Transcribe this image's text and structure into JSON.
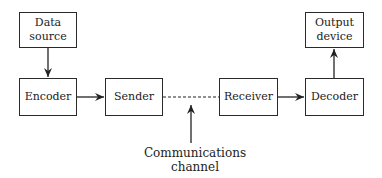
{
  "diagram": {
    "nodes": [
      {
        "id": "data-source",
        "label": "Data\nsource"
      },
      {
        "id": "encoder",
        "label": "Encoder"
      },
      {
        "id": "sender",
        "label": "Sender"
      },
      {
        "id": "receiver",
        "label": "Receiver"
      },
      {
        "id": "decoder",
        "label": "Decoder"
      },
      {
        "id": "output-device",
        "label": "Output\ndevice"
      }
    ],
    "edges": [
      {
        "from": "data-source",
        "to": "encoder",
        "style": "solid-arrow"
      },
      {
        "from": "encoder",
        "to": "sender",
        "style": "solid-arrow"
      },
      {
        "from": "sender",
        "to": "receiver",
        "style": "dashed"
      },
      {
        "from": "receiver",
        "to": "decoder",
        "style": "solid-arrow"
      },
      {
        "from": "decoder",
        "to": "output-device",
        "style": "solid-arrow"
      }
    ],
    "annotation": {
      "label": "Communications\nchannel",
      "points_to": "sender-receiver-link"
    }
  }
}
